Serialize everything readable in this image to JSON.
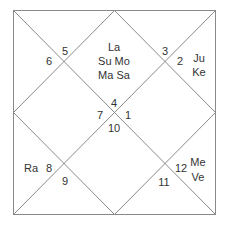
{
  "chart_type": "North Indian Kundli (birth chart)",
  "line_color": "#8a8a8a",
  "text_color": "#333333",
  "houses": [
    {
      "house_position": "top-center",
      "sign_number": "4",
      "planets": [
        "La",
        "Su Mo",
        "Ma Sa"
      ]
    },
    {
      "house_position": "top-left",
      "sign_number": "5",
      "planets": []
    },
    {
      "house_position": "left-upper",
      "sign_number": "6",
      "planets": []
    },
    {
      "house_position": "left-center",
      "sign_number": "7",
      "planets": []
    },
    {
      "house_position": "left-lower",
      "sign_number": "8",
      "planets": [
        "Ra"
      ]
    },
    {
      "house_position": "bottom-left",
      "sign_number": "9",
      "planets": []
    },
    {
      "house_position": "bottom-center",
      "sign_number": "10",
      "planets": []
    },
    {
      "house_position": "bottom-right",
      "sign_number": "11",
      "planets": []
    },
    {
      "house_position": "right-lower",
      "sign_number": "12",
      "planets": [
        "Me",
        "Ve"
      ]
    },
    {
      "house_position": "right-center",
      "sign_number": "1",
      "planets": []
    },
    {
      "house_position": "right-upper",
      "sign_number": "2",
      "planets": [
        "Ju",
        "Ke"
      ]
    },
    {
      "house_position": "top-right",
      "sign_number": "3",
      "planets": []
    }
  ]
}
